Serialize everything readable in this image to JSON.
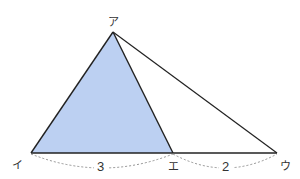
{
  "diagram": {
    "type": "geometry-triangle",
    "colors": {
      "shaded_fill": "#bcd0f2",
      "stroke": "#222222",
      "dashed": "#888888",
      "background": "#ffffff"
    },
    "vertices": {
      "a": {
        "label": "ア",
        "x": 113,
        "y": 32
      },
      "i": {
        "label": "イ",
        "x": 31,
        "y": 153
      },
      "e": {
        "label": "エ",
        "x": 173,
        "y": 153
      },
      "u": {
        "label": "ウ",
        "x": 277,
        "y": 153
      }
    },
    "shaded_triangle": "アイエ",
    "segments": [
      {
        "from": "イ",
        "to": "エ",
        "length_label": "3"
      },
      {
        "from": "エ",
        "to": "ウ",
        "length_label": "2"
      }
    ]
  }
}
